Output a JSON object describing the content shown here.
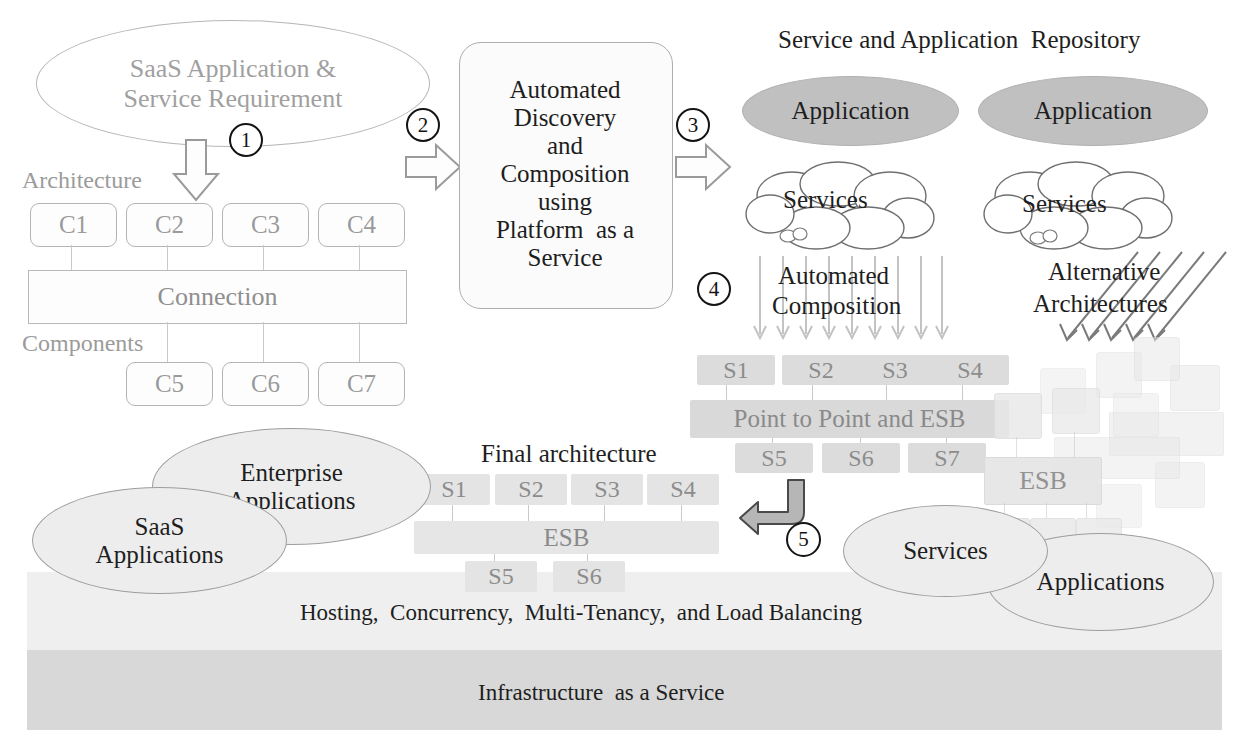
{
  "diagram": {
    "title_repository": "Service and Application  Repository",
    "requirement_ellipse": {
      "line1": "SaaS Application  &",
      "line2": "Service  Requirement"
    },
    "architecture_label": "Architecture",
    "components_label": "Components",
    "connection_label": "Connection",
    "top_components": [
      "C1",
      "C2",
      "C3",
      "C4"
    ],
    "bottom_components": [
      "C5",
      "C6",
      "C7"
    ],
    "process_box": {
      "lines": [
        "Automated",
        "Discovery",
        "and",
        "Composition",
        "using",
        "Platform  as a",
        "Service"
      ]
    },
    "repository": {
      "application_left": "Application",
      "application_right": "Application",
      "services_left": "Services",
      "services_right": "Services"
    },
    "automated_composition": {
      "label_line1": "Automated",
      "label_line2": "Composition",
      "top_services": [
        "S1",
        "S2",
        "S3",
        "S4"
      ],
      "bus_label": "Point to Point and ESB",
      "bottom_services": [
        "S5",
        "S6",
        "S7"
      ]
    },
    "alternative_architectures": {
      "label_line1": "Alternative",
      "label_line2": "Architectures",
      "esb_label": "ESB"
    },
    "final_architecture": {
      "title": "Final architecture",
      "top_services": [
        "S1",
        "S2",
        "S3",
        "S4"
      ],
      "bus_label": "ESB",
      "bottom_services": [
        "S5",
        "S6"
      ]
    },
    "bottom_ellipses": {
      "enterprise_line1": "Enterprise",
      "enterprise_line2": "Applications",
      "saas_line1": "SaaS",
      "saas_line2": "Applications",
      "services": "Services",
      "applications": "Applications"
    },
    "layers": {
      "paas": "Hosting,  Concurrency,  Multi-Tenancy,  and Load Balancing",
      "iaas": "Infrastructure  as a Service"
    },
    "step_numbers": {
      "one": "1",
      "two": "2",
      "three": "3",
      "four": "4",
      "five": "5"
    },
    "colors": {
      "application_ellipse_fill": "#c0c0c0",
      "soft_ellipse_fill": "#ededed",
      "service_box_fill": "#dcdcdc",
      "paas_band": "#efefef",
      "iaas_band": "#d8d8d8",
      "faint_stroke": "#9b9b9b"
    }
  }
}
